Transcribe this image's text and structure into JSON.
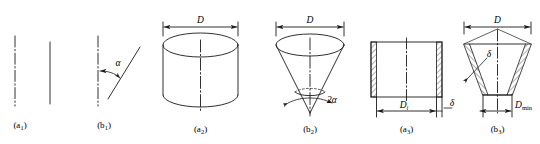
{
  "figure": {
    "type": "engineering-line-diagram",
    "background_color": "#ffffff",
    "line_color": "#1a1a1a",
    "panels": [
      {
        "id": "a1",
        "caption": "(a",
        "caption_sub": "1",
        "caption_close": ")",
        "description": "vertical dash-dot axis line with a plain vertical solid generatrix line parallel to it",
        "labels": []
      },
      {
        "id": "b1",
        "caption": "(b",
        "caption_sub": "1",
        "caption_close": ")",
        "description": "vertical dash-dot axis with an inclined straight generatrix line; included angle alpha marked with arc arrow",
        "labels": [
          {
            "name": "angle-alpha",
            "text": "α"
          }
        ]
      },
      {
        "id": "a2",
        "caption": "(a",
        "caption_sub": "2",
        "caption_close": ")",
        "description": "solid cylinder pictorial with top ellipse, vertical dash-dot axis and overall diameter dimension D above",
        "labels": [
          {
            "name": "diameter-D",
            "text": "D"
          }
        ]
      },
      {
        "id": "b2",
        "caption": "(b",
        "caption_sub": "2",
        "caption_close": ")",
        "description": "solid cone pictorial apex down, top ellipse, vertical dash-dot axis, diameter D above and apex included angle 2 alpha below",
        "labels": [
          {
            "name": "diameter-D",
            "text": "D"
          },
          {
            "name": "apex-angle-2alpha",
            "text": "2α"
          }
        ]
      },
      {
        "id": "a3",
        "caption": "(a",
        "caption_sub": "3",
        "caption_close": ")",
        "description": "cylindrical shell cross-section: rectangle with hatched vertical walls, inner diameter Di dimension and wall thickness delta",
        "labels": [
          {
            "name": "inner-diameter-Di",
            "text": "D",
            "sub": "i"
          },
          {
            "name": "wall-thickness-delta",
            "text": "δ"
          }
        ]
      },
      {
        "id": "b3",
        "caption": "(b",
        "caption_sub": "3",
        "caption_close": ")",
        "description": "conical shell cross-section: trapezoid with hatched inclined walls, top diameter D, wall thickness delta with leader arrow, bottom minimum diameter D min",
        "labels": [
          {
            "name": "diameter-D",
            "text": "D"
          },
          {
            "name": "wall-thickness-delta",
            "text": "δ"
          },
          {
            "name": "minimum-diameter-Dmin",
            "text": "D",
            "sub": "min"
          }
        ]
      }
    ]
  }
}
